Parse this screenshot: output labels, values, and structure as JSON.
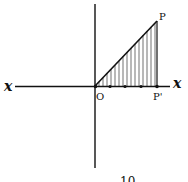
{
  "diagram": {
    "axis_label_left": "x",
    "axis_label_right": "x",
    "origin_label": "O",
    "point_top_label": "P",
    "point_foot_label": "P'",
    "caption_partial": "10",
    "colors": {
      "ink": "#111111",
      "background": "#ffffff"
    }
  }
}
